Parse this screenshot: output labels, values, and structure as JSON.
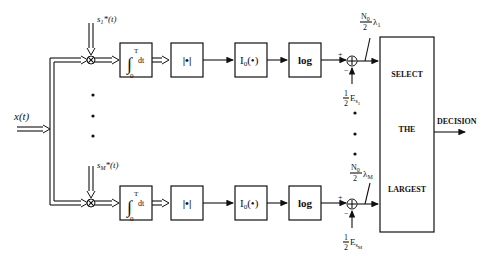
{
  "diagram": {
    "input": {
      "label": "x(t)"
    },
    "branches": [
      {
        "id": "1",
        "reference_signal": "s",
        "reference_sub": "1",
        "reference_suffix": "*(t)",
        "integrator": {
          "upper": "T",
          "lower": "0",
          "body": "dt"
        },
        "magnitude": "|•|",
        "bessel": {
          "main": "I",
          "sub": "0",
          "arg": "(•)"
        },
        "log": "log",
        "sum_plus": "+",
        "sum_minus": "−",
        "energy": {
          "frac_num": "1",
          "frac_den": "2",
          "main": "E",
          "sub": "s",
          "subsub": "1"
        },
        "bias": {
          "num": "N",
          "num_sub": "0",
          "den": "2",
          "lambda": "λ",
          "lambda_sub": "1"
        }
      },
      {
        "id": "M",
        "reference_signal": "s",
        "reference_sub": "M",
        "reference_suffix": "*(t)",
        "integrator": {
          "upper": "T",
          "lower": "0",
          "body": "dt"
        },
        "magnitude": "|•|",
        "bessel": {
          "main": "I",
          "sub": "0",
          "arg": "(•)"
        },
        "log": "log",
        "sum_plus": "+",
        "sum_minus": "−",
        "energy": {
          "frac_num": "1",
          "frac_den": "2",
          "main": "E",
          "sub": "s",
          "subsub": "M"
        },
        "bias": {
          "num": "N",
          "num_sub": "0",
          "den": "2",
          "lambda": "λ",
          "lambda_sub": "M"
        }
      }
    ],
    "selector": {
      "line1": "SELECT",
      "line2": "THE",
      "line3": "LARGEST"
    },
    "output": {
      "label": "DECISION"
    },
    "colors": {
      "ink": "#111111",
      "background": "#ffffff"
    }
  }
}
